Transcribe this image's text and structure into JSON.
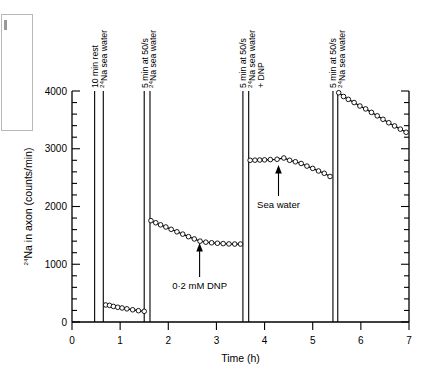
{
  "chart_data": {
    "type": "line",
    "title": "",
    "xlabel": "Time (h)",
    "ylabel": "24Na in axon (counts/min)",
    "ylabel_sup": "24",
    "ylabel_rest": "Na in axon (counts/min)",
    "xlim": [
      0,
      7
    ],
    "ylim": [
      0,
      4000
    ],
    "xticks": [
      0,
      1,
      2,
      3,
      4,
      5,
      6,
      7
    ],
    "xtick_labels": [
      "0",
      "1",
      "2",
      "3",
      "4",
      "5",
      "6",
      "7"
    ],
    "yticks": [
      0,
      1000,
      2000,
      3000,
      4000
    ],
    "ytick_labels": [
      "0",
      "1000",
      "2000",
      "3000",
      "4000"
    ],
    "y_minor_step": 200,
    "grid": false,
    "legend": "none",
    "marker": "open-circle",
    "series": [
      {
        "name": "segment-1-rest",
        "x": [
          0.7,
          0.78,
          0.86,
          0.95,
          1.04,
          1.14,
          1.26,
          1.38,
          1.5
        ],
        "y": [
          295,
          288,
          270,
          255,
          243,
          228,
          212,
          196,
          185
        ]
      },
      {
        "name": "segment-2-dnp",
        "x": [
          1.64,
          1.74,
          1.84,
          1.95,
          2.06,
          2.18,
          2.3,
          2.42,
          2.54,
          2.66,
          2.78,
          2.9,
          3.02,
          3.14,
          3.26,
          3.38,
          3.5
        ],
        "y": [
          1755,
          1718,
          1682,
          1645,
          1605,
          1562,
          1522,
          1478,
          1438,
          1400,
          1382,
          1372,
          1364,
          1358,
          1352,
          1350,
          1350
        ]
      },
      {
        "name": "segment-3-sea-water",
        "x": [
          3.7,
          3.8,
          3.9,
          4.0,
          4.12,
          4.26,
          4.4,
          4.52,
          4.64,
          4.76,
          4.88,
          5.0,
          5.12,
          5.24,
          5.36
        ],
        "y": [
          2800,
          2802,
          2805,
          2808,
          2812,
          2818,
          2840,
          2800,
          2775,
          2745,
          2700,
          2660,
          2615,
          2575,
          2520
        ]
      },
      {
        "name": "segment-4-final",
        "x": [
          5.54,
          5.64,
          5.74,
          5.86,
          5.98,
          6.1,
          6.22,
          6.34,
          6.46,
          6.58,
          6.7,
          6.82,
          6.94
        ],
        "y": [
          3970,
          3905,
          3855,
          3800,
          3740,
          3690,
          3630,
          3570,
          3510,
          3450,
          3395,
          3340,
          3285
        ]
      }
    ],
    "event_lines": [
      {
        "x": 0.47,
        "name": "line-10-min-rest"
      },
      {
        "x": 0.65,
        "name": "line-na-sea-water-1"
      },
      {
        "x": 1.5,
        "name": "line-5-min-50s-1"
      },
      {
        "x": 1.62,
        "name": "line-na-sea-water-2"
      },
      {
        "x": 3.55,
        "name": "line-5-min-50s-2"
      },
      {
        "x": 3.67,
        "name": "line-na-sea-water-dnp"
      },
      {
        "x": 5.42,
        "name": "line-5-min-50s-3"
      },
      {
        "x": 5.52,
        "name": "line-na-sea-water-3"
      }
    ],
    "event_labels": [
      {
        "x": 0.47,
        "lines": [
          "10 min rest"
        ],
        "sup": false
      },
      {
        "x": 0.65,
        "lines": [
          "Na sea water"
        ],
        "sup": true
      },
      {
        "x": 1.5,
        "lines": [
          "5 min at 50/s"
        ],
        "sup": false
      },
      {
        "x": 1.62,
        "lines": [
          "Na sea water"
        ],
        "sup": true
      },
      {
        "x": 3.55,
        "lines": [
          "5 min at 50/s"
        ],
        "sup": false
      },
      {
        "x": 3.67,
        "lines": [
          "Na sea water"
        ],
        "sup": true
      },
      {
        "x": 3.8,
        "lines": [
          "+ DNP"
        ],
        "sup": false
      },
      {
        "x": 5.42,
        "lines": [
          "5 min at 50/s"
        ],
        "sup": false
      },
      {
        "x": 5.52,
        "lines": [
          "Na sea water"
        ],
        "sup": true
      }
    ],
    "annotations": [
      {
        "name": "dnp-annotation",
        "text": "0·2 mM DNP",
        "x": 2.65,
        "y": 1380,
        "arrow": "up"
      },
      {
        "name": "sea-water-annotation",
        "text": "Sea water",
        "x": 4.28,
        "y": 2800,
        "arrow": "up"
      }
    ]
  }
}
